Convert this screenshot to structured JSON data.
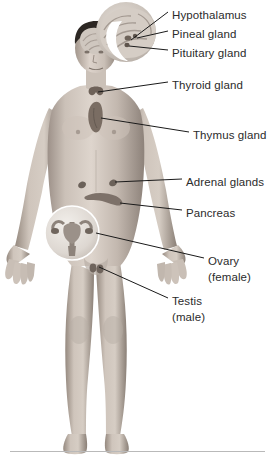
{
  "diagram": {
    "background_color": "#ffffff",
    "text_color": "#2b2b2b",
    "leader_line_color": "#1a1a1a",
    "rule_color": "#b9b9b9"
  },
  "labels": [
    {
      "id": "hypothalamus",
      "text": "Hypothalamus",
      "sub": "",
      "x": 172,
      "y": 8
    },
    {
      "id": "pineal-gland",
      "text": "Pineal gland",
      "sub": "",
      "x": 172,
      "y": 27
    },
    {
      "id": "pituitary-gland",
      "text": "Pituitary gland",
      "sub": "",
      "x": 172,
      "y": 46
    },
    {
      "id": "thyroid-gland",
      "text": "Thyroid gland",
      "sub": "",
      "x": 172,
      "y": 78
    },
    {
      "id": "thymus-gland",
      "text": "Thymus gland",
      "sub": "",
      "x": 193,
      "y": 128
    },
    {
      "id": "adrenal-glands",
      "text": "Adrenal glands",
      "sub": "",
      "x": 186,
      "y": 175
    },
    {
      "id": "pancreas",
      "text": "Pancreas",
      "sub": "",
      "x": 186,
      "y": 206
    },
    {
      "id": "ovary",
      "text": "Ovary",
      "sub": "(female)",
      "x": 208,
      "y": 254
    },
    {
      "id": "testis",
      "text": "Testis",
      "sub": "(male)",
      "x": 172,
      "y": 294
    }
  ],
  "body_figure": {
    "name": "standing-male-anatomical-figure",
    "description": "Grayscale photographic standing male figure, front view, arms slightly away from body",
    "skin_tone_light": "#d8cec6",
    "skin_tone_mid": "#b3a79d",
    "skin_tone_shadow": "#8a7f76"
  },
  "insets": [
    {
      "id": "brain-inset",
      "name": "magnified-brain-inset",
      "description": "Circular magnified cutaway of the brain showing hypothalamus, pineal and pituitary",
      "cx": 126,
      "cy": 32,
      "r": 30
    },
    {
      "id": "ovary-inset",
      "name": "magnified-uterus-ovary-inset",
      "description": "Circular magnified inset of uterus, fallopian tubes and ovaries",
      "cx": 72,
      "cy": 233,
      "r": 27
    }
  ],
  "organs": [
    {
      "id": "thyroid",
      "name": "thyroid-gland-organ",
      "color": "#6e6259"
    },
    {
      "id": "thymus",
      "name": "thymus-gland-organ",
      "color": "#7a6d63"
    },
    {
      "id": "adrenals",
      "name": "adrenal-glands-organ",
      "color": "#6b6159"
    },
    {
      "id": "pancreas",
      "name": "pancreas-organ",
      "color": "#7d7169"
    },
    {
      "id": "testis",
      "name": "testis-organ",
      "color": "#6f645c"
    }
  ]
}
